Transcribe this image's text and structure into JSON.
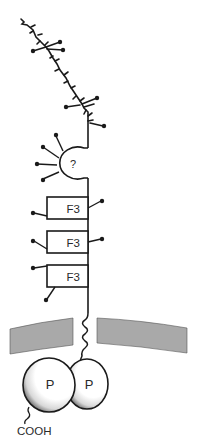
{
  "diagram": {
    "type": "protein-domain-schematic",
    "domains": {
      "unknown": {
        "label": "?"
      },
      "fibronectin": [
        {
          "label": "F3"
        },
        {
          "label": "F3"
        },
        {
          "label": "F3"
        }
      ],
      "intracellular": [
        {
          "label": "P"
        },
        {
          "label": "P"
        }
      ]
    },
    "terminus": {
      "label": "COOH"
    },
    "colors": {
      "line": "#1a1a1a",
      "membrane": "#a9a9a9",
      "domain_fill": "#ffffff",
      "shadow": "#8a8a8a",
      "background": "#ffffff"
    }
  }
}
